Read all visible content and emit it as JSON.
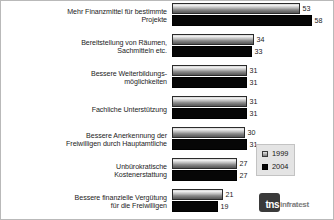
{
  "chart_data": {
    "type": "bar",
    "orientation": "horizontal",
    "title": "",
    "xlabel": "",
    "ylabel": "",
    "xlim": [
      0,
      60
    ],
    "grid": false,
    "legend_position": "right-bottom",
    "categories": [
      "Mehr Finanzmittel für bestimmte Projekte",
      "Bereitstellung von Räumen, Sachmitteln etc.",
      "Bessere Weiterbildungs-möglichkeiten",
      "Fachliche Unterstützung",
      "Bessere Anerkennung der Freiwilligen durch Hauptamtliche",
      "Unbürokratische Kostenerstattung",
      "Bessere finanzielle Vergütung für die Freiwilligen"
    ],
    "series": [
      {
        "name": "1999",
        "color": "#9a9a9a",
        "values": [
          53,
          34,
          31,
          31,
          30,
          27,
          21
        ]
      },
      {
        "name": "2004",
        "color": "#060606",
        "values": [
          58,
          33,
          31,
          31,
          31,
          27,
          19
        ]
      }
    ]
  },
  "rows": [
    {
      "label_line1": "Mehr Finanzmittel für bestimmte",
      "label_line2": "Projekte",
      "v1999": 53,
      "v2004": 58
    },
    {
      "label_line1": "Bereitstellung von Räumen,",
      "label_line2": "Sachmitteln etc.",
      "v1999": 34,
      "v2004": 33
    },
    {
      "label_line1": "Bessere Weiterbildungs-",
      "label_line2": "möglichkeiten",
      "v1999": 31,
      "v2004": 31
    },
    {
      "label_line1": "Fachliche Unterstützung",
      "label_line2": "",
      "v1999": 31,
      "v2004": 31
    },
    {
      "label_line1": "Bessere Anerkennung der",
      "label_line2": "Freiwilligen durch Hauptamtliche",
      "v1999": 30,
      "v2004": 31
    },
    {
      "label_line1": "Unbürokratische",
      "label_line2": "Kostenerstattung",
      "v1999": 27,
      "v2004": 27
    },
    {
      "label_line1": "Bessere finanzielle Vergütung",
      "label_line2": "für die Freiwilligen",
      "v1999": 21,
      "v2004": 19
    }
  ],
  "legend": {
    "items": [
      {
        "label": "1999",
        "color": "#9a9a9a"
      },
      {
        "label": "2004",
        "color": "#060606"
      }
    ]
  },
  "brand": {
    "mark": "tns",
    "word": "infratest"
  }
}
